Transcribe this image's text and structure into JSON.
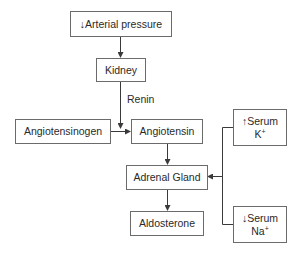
{
  "diagram": {
    "nodes": {
      "arterial_pressure": {
        "arrow": "↓",
        "text": "Arterial pressure"
      },
      "kidney": {
        "text": "Kidney"
      },
      "angiotensinogen": {
        "text": "Angiotensinogen"
      },
      "angiotensin": {
        "text": "Angiotensin"
      },
      "adrenal_gland": {
        "text": "Adrenal Gland"
      },
      "aldosterone": {
        "text": "Aldosterone"
      },
      "serum_k": {
        "arrow": "↑",
        "line1": "Serum",
        "ion": "K",
        "charge": "+"
      },
      "serum_na": {
        "arrow": "↓",
        "line1": "Serum",
        "ion": "Na",
        "charge": "+"
      }
    },
    "edge_labels": {
      "renin": "Renin"
    },
    "edges": [
      {
        "from": "arterial_pressure",
        "to": "kidney"
      },
      {
        "from": "kidney",
        "to": "angiotensin",
        "label": "Renin"
      },
      {
        "from": "angiotensinogen",
        "to": "angiotensin"
      },
      {
        "from": "angiotensin",
        "to": "adrenal_gland"
      },
      {
        "from": "adrenal_gland",
        "to": "aldosterone"
      },
      {
        "from": "serum_k",
        "to": "adrenal_gland"
      },
      {
        "from": "serum_na",
        "to": "adrenal_gland"
      }
    ],
    "colors": {
      "line": "#3a3a3a",
      "border": "#6b6b6b",
      "text": "#2a2a2a"
    }
  }
}
